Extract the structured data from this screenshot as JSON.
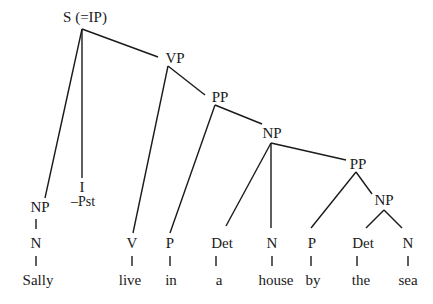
{
  "diagram": {
    "type": "syntax-tree",
    "nodes": {
      "s": "S (=IP)",
      "vp": "VP",
      "pp1": "PP",
      "np1": "NP",
      "pp2": "PP",
      "np2": "NP",
      "np_subj": "NP",
      "n_subj": "N",
      "i": "I",
      "i_feat": "–Pst",
      "v": "V",
      "p1": "P",
      "det1": "Det",
      "n1": "N",
      "p2": "P",
      "det2": "Det",
      "n2": "N"
    },
    "words": {
      "sally": "Sally",
      "live": "live",
      "in": "in",
      "a": "a",
      "house": "house",
      "by": "by",
      "the": "the",
      "sea": "sea"
    }
  }
}
